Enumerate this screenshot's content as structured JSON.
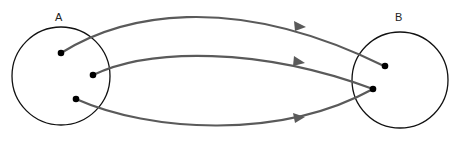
{
  "diagram": {
    "type": "mapping",
    "sets": [
      {
        "id": "A",
        "label": "A",
        "elements": [
          "a1",
          "a2",
          "a3"
        ]
      },
      {
        "id": "B",
        "label": "B",
        "elements": [
          "b1",
          "b2"
        ]
      }
    ],
    "mappings": [
      {
        "from": "a1",
        "to": "b1"
      },
      {
        "from": "a2",
        "to": "b2"
      },
      {
        "from": "a3",
        "to": "b2"
      }
    ],
    "colors": {
      "circle": "#111111",
      "point": "#000000",
      "arrow": "#5a5a5a"
    }
  }
}
